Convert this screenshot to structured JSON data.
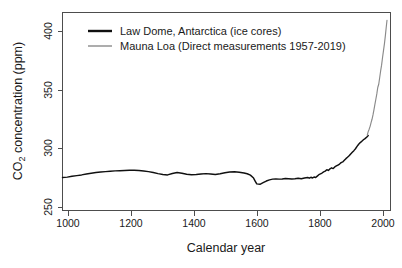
{
  "chart_data": {
    "type": "line",
    "title": "",
    "xlabel": "Calendar year",
    "ylabel": "CO2 concentration (ppm)",
    "ylabel_parts": {
      "pre": "CO",
      "sub": "2",
      "post": " concentration (ppm)"
    },
    "xlim": [
      1000,
      2030
    ],
    "ylim": [
      250,
      418
    ],
    "xticks": [
      1000,
      1200,
      1400,
      1600,
      1800,
      2000
    ],
    "xtick_labels": [
      "1000",
      "1200",
      "1400",
      "1600",
      "1800",
      "2000"
    ],
    "yticks": [
      250,
      300,
      350,
      400
    ],
    "ytick_labels": [
      "250",
      "300",
      "350",
      "400"
    ],
    "grid": false,
    "legend_position": "top-left",
    "series": [
      {
        "name": "Law Dome, Antarctica (ice cores)",
        "color": "#101010",
        "linewidth": 1.45,
        "x": [
          1000,
          1015,
          1030,
          1045,
          1060,
          1075,
          1090,
          1105,
          1120,
          1135,
          1150,
          1165,
          1180,
          1195,
          1210,
          1225,
          1240,
          1255,
          1270,
          1285,
          1300,
          1315,
          1330,
          1345,
          1360,
          1375,
          1390,
          1405,
          1420,
          1435,
          1450,
          1465,
          1480,
          1495,
          1510,
          1525,
          1540,
          1555,
          1570,
          1580,
          1590,
          1600,
          1605,
          1610,
          1620,
          1630,
          1640,
          1650,
          1660,
          1670,
          1680,
          1690,
          1700,
          1710,
          1720,
          1730,
          1740,
          1750,
          1760,
          1770,
          1775,
          1780,
          1785,
          1790,
          1795,
          1800,
          1805,
          1810,
          1815,
          1820,
          1825,
          1830,
          1835,
          1840,
          1845,
          1850,
          1855,
          1860,
          1865,
          1870,
          1875,
          1880,
          1885,
          1890,
          1895,
          1900,
          1905,
          1910,
          1915,
          1920,
          1925,
          1930,
          1935,
          1940,
          1945,
          1950,
          1955,
          1958,
          1960
        ],
        "y": [
          278.0,
          278.3,
          279.0,
          279.6,
          280.2,
          281.0,
          281.6,
          282.2,
          282.6,
          283.0,
          283.3,
          283.6,
          283.8,
          284.0,
          284.2,
          284.1,
          283.9,
          283.5,
          283.0,
          282.2,
          281.3,
          280.6,
          280.2,
          281.4,
          282.2,
          281.6,
          280.8,
          280.4,
          280.6,
          281.0,
          281.3,
          281.0,
          280.6,
          281.2,
          282.0,
          282.6,
          282.8,
          282.5,
          281.8,
          281.2,
          280.0,
          277.5,
          275.0,
          272.6,
          272.2,
          273.6,
          275.0,
          276.0,
          276.6,
          276.8,
          276.6,
          276.8,
          277.2,
          277.0,
          276.8,
          277.0,
          277.4,
          277.0,
          277.6,
          278.0,
          277.4,
          278.2,
          277.6,
          278.4,
          278.0,
          279.2,
          280.4,
          281.0,
          281.8,
          282.8,
          283.4,
          284.6,
          284.0,
          285.4,
          286.2,
          285.6,
          287.0,
          287.8,
          288.6,
          289.4,
          290.6,
          291.2,
          292.6,
          294.0,
          295.2,
          296.4,
          298.0,
          299.4,
          300.8,
          302.4,
          304.4,
          306.2,
          307.6,
          308.8,
          310.0,
          311.0,
          312.2,
          313.0,
          313.6
        ]
      },
      {
        "name": "Mauna Loa (Direct measurements 1957-2019)",
        "color": "#8a8a8a",
        "linewidth": 1.15,
        "x": [
          1957,
          1960,
          1963,
          1966,
          1969,
          1972,
          1975,
          1978,
          1981,
          1984,
          1987,
          1990,
          1993,
          1996,
          1999,
          2002,
          2005,
          2008,
          2011,
          2014,
          2017,
          2019
        ],
        "y": [
          314.0,
          316.9,
          319.0,
          321.4,
          324.6,
          327.4,
          331.1,
          335.4,
          340.1,
          344.4,
          348.9,
          354.4,
          357.1,
          362.6,
          368.4,
          373.3,
          379.8,
          385.6,
          391.6,
          398.6,
          406.6,
          411.4
        ]
      }
    ],
    "legend": [
      {
        "label": "Law Dome, Antarctica (ice cores)",
        "color": "#101010",
        "style": "thick"
      },
      {
        "label": "Mauna Loa (Direct measurements 1957-2019)",
        "color": "#8a8a8a",
        "style": "thin"
      }
    ],
    "colors": {
      "background": "#ffffff",
      "axis": "#4d4d4d",
      "text": "#1a1a1a",
      "series_ice_core": "#101010",
      "series_direct": "#8a8a8a"
    }
  }
}
